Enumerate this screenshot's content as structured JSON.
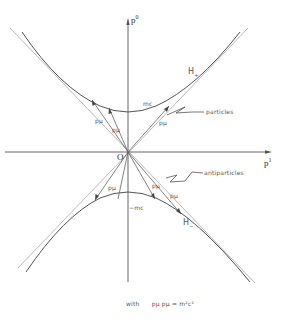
{
  "diagram": {
    "type": "spacetime-momentum-diagram",
    "axes": {
      "vertical": {
        "label": "p",
        "superscript": "0"
      },
      "horizontal": {
        "label": "p",
        "superscript": "1"
      },
      "origin_label": "O"
    },
    "hyperbolas": {
      "upper": {
        "label": "H",
        "subscript": "+",
        "vertex_label": "mc"
      },
      "lower": {
        "label": "H",
        "subscript": "−",
        "vertex_label": "−mc"
      }
    },
    "vector_labels": {
      "upper": [
        "pµ",
        "pµ",
        "pµ"
      ],
      "lower": [
        "pµ",
        "pµ",
        "pµ"
      ]
    },
    "annotations": {
      "particles": "particles",
      "antiparticles": "antiparticles"
    },
    "caption": {
      "prefix": "with",
      "equation": "pµ pµ = m²c²"
    },
    "colors": {
      "ink": "#555555",
      "light_ink": "#999999",
      "background": "#ffffff"
    }
  }
}
